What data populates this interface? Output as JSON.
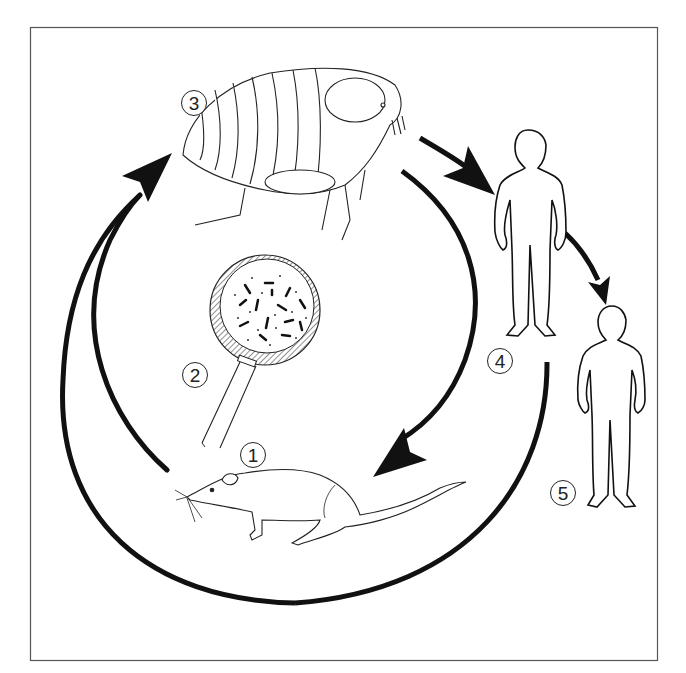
{
  "diagram": {
    "type": "transmission-cycle",
    "frame": {
      "stroke": "#555555",
      "background": "#ffffff"
    },
    "colors": {
      "ink": "#111111",
      "line": "#222222",
      "hatch": "#444444"
    },
    "nodes": [
      {
        "id": "1",
        "label": "1",
        "depicts": "rat",
        "icon": "rat-icon"
      },
      {
        "id": "2",
        "label": "2",
        "depicts": "magnifying glass showing bacteria",
        "icon": "magnifier-bacteria-icon"
      },
      {
        "id": "3",
        "label": "3",
        "depicts": "flea",
        "icon": "flea-icon"
      },
      {
        "id": "4",
        "label": "4",
        "depicts": "human (first)",
        "icon": "human-silhouette-icon"
      },
      {
        "id": "5",
        "label": "5",
        "depicts": "human (second)",
        "icon": "human-silhouette-icon"
      }
    ],
    "edges": [
      {
        "from": "1",
        "to": "3",
        "style": "thick arrow, left inner arc"
      },
      {
        "from": "1",
        "to": "3",
        "style": "thick arrow, left outer arc (large loop)"
      },
      {
        "from": "3",
        "to": "1",
        "style": "thick arrow, right arc"
      },
      {
        "from": "3",
        "to": "4",
        "style": "short thick arrow"
      },
      {
        "from": "4",
        "to": "5",
        "style": "short thick arrow"
      },
      {
        "from": "4",
        "to": "1",
        "style": "large lower arc joining loop"
      }
    ]
  }
}
